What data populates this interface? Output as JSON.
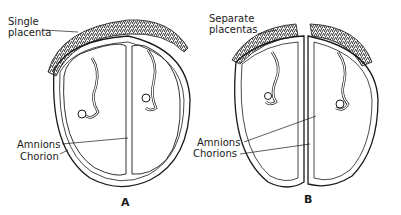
{
  "figure": {
    "panels": [
      {
        "id": "A",
        "letter": "A",
        "placenta_label_line1": "Single",
        "placenta_label_line2": "placenta",
        "amnion_label": "Amnions",
        "chorion_label": "Chorion"
      },
      {
        "id": "B",
        "letter": "B",
        "placenta_label_line1": "Separate",
        "placenta_label_line2": "placentas",
        "amnion_label": "Amnions",
        "chorion_label": "Chorions"
      }
    ],
    "colors": {
      "line": "#1a1a1a",
      "background": "#ffffff"
    }
  }
}
